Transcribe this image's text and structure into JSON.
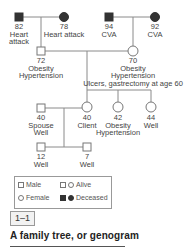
{
  "people": {
    "pat_grandfather": {
      "age": "82",
      "line1": "Heart",
      "line2": "attack",
      "sex": "male",
      "status": "deceased"
    },
    "pat_grandmother": {
      "age": "78",
      "line1": "Heart attack",
      "sex": "female",
      "status": "deceased"
    },
    "mat_grandfather": {
      "age": "94",
      "line1": "CVA",
      "sex": "male",
      "status": "deceased"
    },
    "mat_grandmother": {
      "age": "92",
      "line1": "CVA",
      "sex": "female",
      "status": "deceased"
    },
    "father": {
      "age": "72",
      "line1": "Obesity",
      "line2": "Hypertension",
      "sex": "male",
      "status": "alive"
    },
    "mother": {
      "age": "70",
      "line1": "Obesity",
      "line2": "Hypertension",
      "line3": "Ulcers, gastrectomy at age 60",
      "sex": "female",
      "status": "alive"
    },
    "spouse": {
      "age": "40",
      "line1": "Spouse",
      "line2": "Well",
      "sex": "male",
      "status": "alive"
    },
    "client": {
      "age": "40",
      "line1": "Client",
      "sex": "female",
      "status": "alive"
    },
    "sister_42": {
      "age": "42",
      "line1": "Obesity",
      "line2": "Hypertension",
      "sex": "female",
      "status": "alive"
    },
    "sister_44": {
      "age": "44",
      "line1": "Well",
      "sex": "female",
      "status": "alive"
    },
    "son_12": {
      "age": "12",
      "line1": "Well",
      "sex": "male",
      "status": "alive"
    },
    "son_7": {
      "age": "7",
      "line1": "Well",
      "sex": "male",
      "status": "alive"
    }
  },
  "legend": {
    "male": "Male",
    "female": "Female",
    "alive": "Alive",
    "deceased": "Deceased"
  },
  "figure": {
    "number": "1–1",
    "caption": "A family tree, or genogram"
  },
  "colors": {
    "line": "#8a8a8a",
    "deceased_fill": "#333333",
    "outline": "#777777"
  }
}
